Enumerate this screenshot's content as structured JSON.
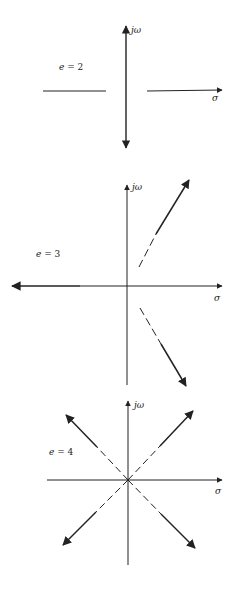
{
  "figure": {
    "panels": [
      {
        "id": "e2",
        "label_var": "e",
        "label_eq": " = 2",
        "axis_vertical_label": "jω",
        "axis_horizontal_label": "σ"
      },
      {
        "id": "e3",
        "label_var": "e",
        "label_eq": " = 3",
        "axis_vertical_label": "jω",
        "axis_horizontal_label": "σ"
      },
      {
        "id": "e4",
        "label_var": "e",
        "label_eq": " = 4",
        "axis_vertical_label": "jω",
        "axis_horizontal_label": "σ"
      }
    ],
    "colors": {
      "ink": "#222222",
      "background": "#ffffff"
    }
  }
}
